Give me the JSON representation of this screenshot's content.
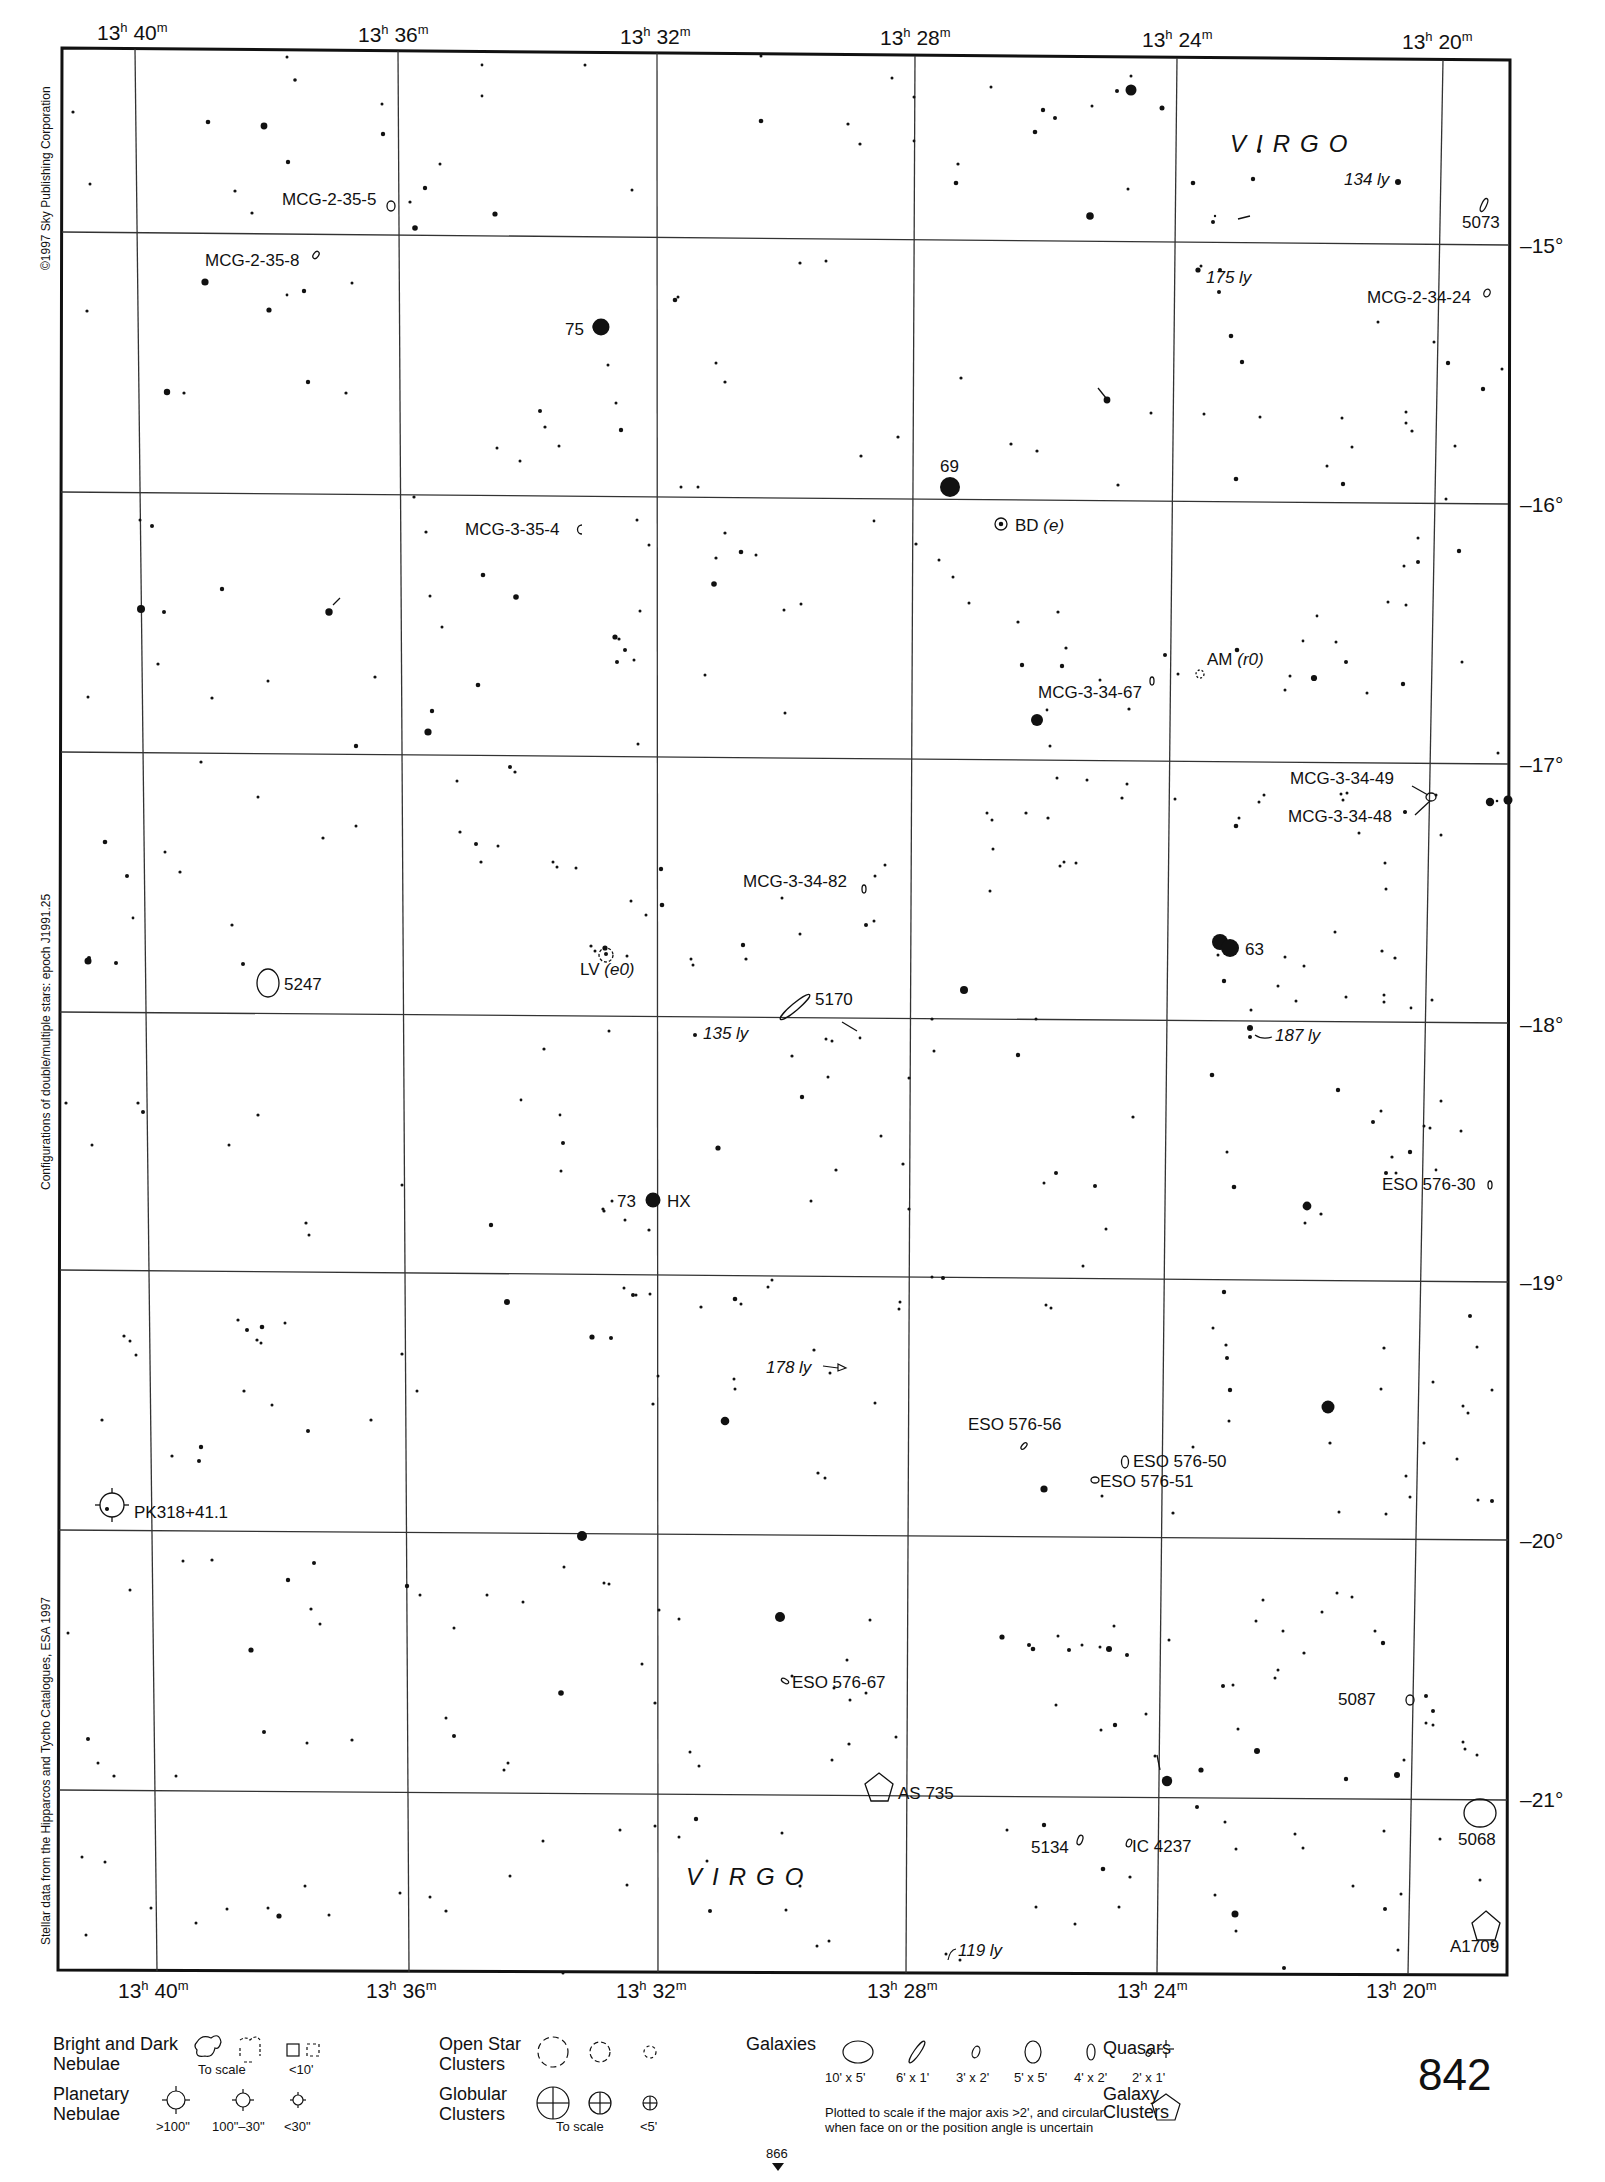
{
  "page": {
    "number": "842",
    "next_page_ref": "866"
  },
  "side_notes": {
    "copyright": "©1997 Sky Publishing Corporation",
    "epoch_note": "Configurations of double/multiple stars: epoch J1991.25",
    "data_source": "Stellar data from the Hipparcos and Tycho Catalogues, ESA 1997"
  },
  "axes": {
    "ra_labels": [
      {
        "h": "13",
        "m": "40"
      },
      {
        "h": "13",
        "m": "36"
      },
      {
        "h": "13",
        "m": "32"
      },
      {
        "h": "13",
        "m": "28"
      },
      {
        "h": "13",
        "m": "24"
      },
      {
        "h": "13",
        "m": "20"
      }
    ],
    "dec_labels": [
      "–15°",
      "–16°",
      "–17°",
      "–18°",
      "–19°",
      "–20°",
      "–21°"
    ]
  },
  "constellation": {
    "name_top": "VIRGO",
    "name_bottom": "VIRGO"
  },
  "objects": {
    "mcg_2_35_5": "MCG-2-35-5",
    "mcg_2_35_8": "MCG-2-35-8",
    "star_75": "75",
    "star_69": "69",
    "bd_e": "BD",
    "bd_e_type": "(e)",
    "mcg_3_35_4": "MCG-3-35-4",
    "mcg_3_34_67": "MCG-3-34-67",
    "am_r0": "AM",
    "am_r0_type": "(r0)",
    "mcg_3_34_49": "MCG-3-34-49",
    "mcg_3_34_48": "MCG-3-34-48",
    "mcg_3_34_82": "MCG-3-34-82",
    "star_63": "63",
    "ngc_5247": "5247",
    "lv_e0": "LV",
    "lv_e0_type": "(e0)",
    "ngc_5170": "5170",
    "ly_135": "135 ly",
    "ly_187": "187 ly",
    "ly_134": "134 ly",
    "ly_175": "175 ly",
    "ly_178": "178 ly",
    "ly_119": "119 ly",
    "ngc_5073": "5073",
    "mcg_2_34_24": "MCG-2-34-24",
    "star_73": "73",
    "hx": "HX",
    "eso_576_30": "ESO 576-30",
    "eso_576_56": "ESO 576-56",
    "eso_576_50": "ESO 576-50",
    "eso_576_51": "ESO 576-51",
    "pk318": "PK318+41.1",
    "eso_576_67": "ESO 576-67",
    "ngc_5087": "5087",
    "as_735": "AS 735",
    "ngc_5134": "5134",
    "ic_4237": "IC 4237",
    "ngc_5068": "5068",
    "a1709": "A1709"
  },
  "legend": {
    "nebulae": {
      "title_line1": "Bright and Dark",
      "title_line2": "Nebulae",
      "to_scale": "To scale",
      "small": "<10'"
    },
    "planetary": {
      "title_line1": "Planetary",
      "title_line2": "Nebulae",
      "sizes": [
        ">100\"",
        "100\"–30\"",
        "<30\""
      ]
    },
    "open_clusters": {
      "title_line1": "Open Star",
      "title_line2": "Clusters"
    },
    "globular": {
      "title_line1": "Globular",
      "title_line2": "Clusters",
      "to_scale": "To scale",
      "small": "<5'"
    },
    "galaxies": {
      "title": "Galaxies",
      "sizes": [
        "10' x 5'",
        "6' x 1'",
        "3' x 2'",
        "5' x 5'",
        "4' x 2'",
        "2' x 1'"
      ],
      "note_line1": "Plotted to scale if the major axis >2', and circular",
      "note_line2": "when face on or the position angle is uncertain"
    },
    "quasars": {
      "title": "Quasars"
    },
    "galaxy_clusters": {
      "title_line1": "Galaxy",
      "title_line2": "Clusters"
    }
  }
}
